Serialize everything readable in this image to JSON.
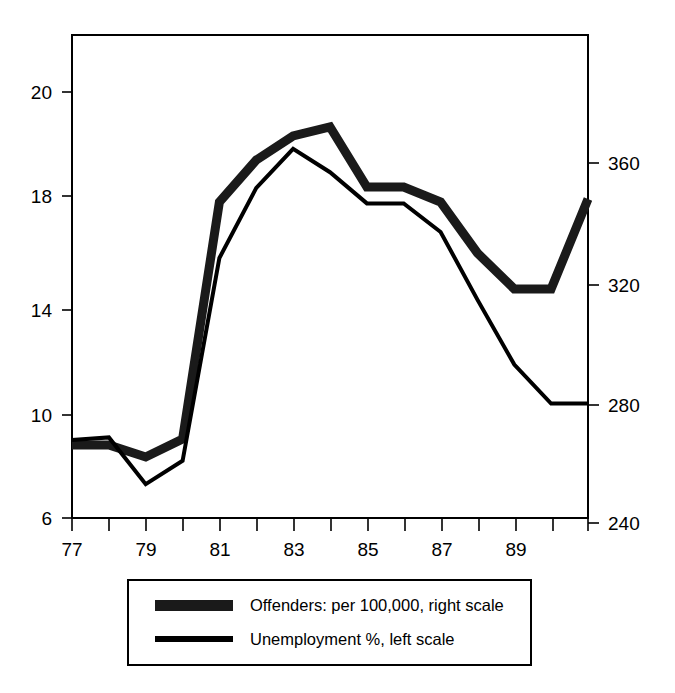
{
  "chart_data": {
    "type": "line",
    "title": "",
    "subtitle": "",
    "xlabel": "",
    "ylabel": "",
    "grid": false,
    "legend_position": "bottom",
    "x": [
      77,
      78,
      79,
      80,
      81,
      82,
      83,
      84,
      85,
      86,
      87,
      88,
      89,
      90,
      91
    ],
    "x_tick_labels": [
      "77",
      "",
      "79",
      "",
      "81",
      "",
      "83",
      "",
      "85",
      "",
      "87",
      "",
      "89",
      "",
      ""
    ],
    "x_tick_labels_shown": [
      "77",
      "79",
      "81",
      "83",
      "85",
      "87",
      "89"
    ],
    "left_axis": {
      "label": "Unemployment %, left scale",
      "ticks": [
        6,
        10,
        14,
        18,
        20
      ],
      "tick_labels": [
        "6",
        "10",
        "14",
        "18",
        "20"
      ],
      "ylim": [
        6,
        20.8
      ]
    },
    "right_axis": {
      "label": "Offenders: per 100,000, right scale",
      "ticks": [
        240,
        280,
        320,
        360
      ],
      "tick_labels": [
        "240",
        "280",
        "320",
        "360"
      ],
      "ylim": [
        240,
        380
      ]
    },
    "series": [
      {
        "name": "Offenders: per 100,000, right scale",
        "axis": "right",
        "style": "thick-textured",
        "color": "#1a1a1a",
        "values": [
          266,
          266,
          262,
          268,
          347,
          361,
          369,
          372,
          352,
          352,
          347,
          330,
          318,
          318,
          348
        ]
      },
      {
        "name": "Unemployment %, left scale",
        "axis": "left",
        "style": "thin-solid",
        "color": "#000000",
        "values": [
          9.0,
          9.1,
          7.3,
          8.2,
          16.0,
          18.7,
          20.2,
          19.3,
          18.1,
          18.1,
          17.0,
          14.4,
          11.9,
          10.4,
          10.4
        ]
      }
    ]
  },
  "legend": {
    "entries": [
      {
        "swatch": "thick-textured-line",
        "label": "Offenders: per 100,000, right scale"
      },
      {
        "swatch": "thin-solid-line",
        "label": "Unemployment %, left scale"
      }
    ]
  },
  "axis_tick_text": {
    "left": [
      "20",
      "18",
      "14",
      "10",
      "6"
    ],
    "right": [
      "360",
      "320",
      "280",
      "240"
    ],
    "bottom": [
      "77",
      "79",
      "81",
      "83",
      "85",
      "87",
      "89"
    ]
  },
  "colors": {
    "ink": "#000000",
    "offenders": "#1a1a1a",
    "unemployment": "#000000",
    "background": "#ffffff"
  }
}
